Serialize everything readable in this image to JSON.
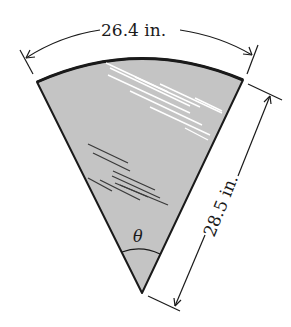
{
  "diagram": {
    "type": "circular-sector (windshield wiper region)",
    "arc_length_label": "26.4 in.",
    "radius_label": "28.5 in.",
    "angle_label": "θ",
    "colors": {
      "sector_fill": "#c4c4c4",
      "outline": "#1a1a1a",
      "glare_lines": "#ffffff",
      "shade_lines": "#3a3a3a",
      "background": "#ffffff"
    }
  }
}
